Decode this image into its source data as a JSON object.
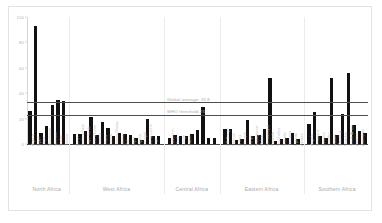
{
  "chart_data": {
    "type": "bar",
    "title": "",
    "subtitle": "",
    "xlabel": "",
    "ylabel": "",
    "ylim": [
      0,
      100
    ],
    "yticks": [
      0,
      20,
      40,
      60,
      80,
      100
    ],
    "ytick_labels": [
      "0",
      "20",
      "40",
      "60",
      "80",
      "100"
    ],
    "grid": false,
    "legend_position": "inline-annotation",
    "reference_lines": [
      {
        "label": "Global average: 32.8",
        "value": 32.8
      },
      {
        "label": "WHO threshold 23",
        "value": 23
      }
    ],
    "group_labels": [
      "North Africa",
      "West Africa",
      "Central Africa",
      "Eastern Africa",
      "Southern Africa"
    ],
    "groups": [
      {
        "name": "North Africa",
        "categories": [
          "Algeria",
          "Egypt",
          "Libya",
          "Mauritania",
          "Morocco",
          "Sudan",
          "Tunisia"
        ],
        "values": [
          26,
          93,
          9,
          14,
          31,
          35,
          34
        ]
      },
      {
        "name": "West Africa",
        "categories": [
          "Benin",
          "Burkina Faso",
          "Cape Verde",
          "Côte d'Ivoire",
          "Gambia",
          "Ghana",
          "Guinea",
          "Guinea-Bissau",
          "Liberia",
          "Mali",
          "Niger",
          "Nigeria",
          "Senegal",
          "Sierra Leone",
          "Togo"
        ],
        "values": [
          8,
          8,
          10,
          21,
          7,
          17,
          13,
          6,
          9,
          8,
          7,
          5,
          3,
          20,
          6,
          6
        ]
      },
      {
        "name": "Central Africa",
        "categories": [
          "Cameroon",
          "Chad",
          "Congo",
          "Gabon"
        ],
        "values": [
          5,
          7,
          6,
          6,
          8,
          11,
          29,
          5,
          5
        ]
      },
      {
        "name": "Eastern Africa",
        "categories": [
          "DR Congo",
          "Djibouti",
          "Eritrea",
          "Ethiopia",
          "Kenya",
          "Madagascar",
          "Malawi",
          "Mozambique",
          "Rwanda",
          "Seychelles",
          "Somalia",
          "Tanzania",
          "Uganda",
          "Zambia"
        ],
        "values": [
          12,
          12,
          3,
          4,
          19,
          6,
          7,
          12,
          52,
          2,
          4,
          5,
          9,
          4
        ]
      },
      {
        "name": "Southern Africa",
        "categories": [
          "Angola",
          "Botswana",
          "Eswatini",
          "Lesotho",
          "Malawi",
          "Mauritius",
          "Namibia",
          "South Africa",
          "Zambia",
          "Zimbabwe"
        ],
        "values": [
          16,
          25,
          6,
          5,
          52,
          7,
          24,
          56,
          15,
          10,
          9
        ]
      }
    ]
  }
}
